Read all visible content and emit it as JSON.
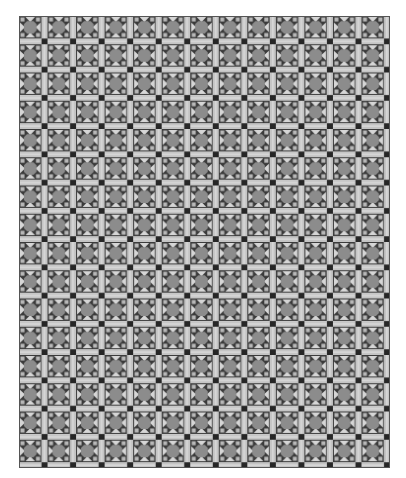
{
  "image": {
    "description": "Repeating quilt pattern of square blocks with sashing",
    "columns": 13,
    "rows": 16,
    "tile_size_px": 28.5
  },
  "colors": {
    "background": "#ffffff",
    "block_dark": "#3a3a3a",
    "center_square": "#8c8c8c",
    "triangles": "#d6d6d6",
    "sashing": "#c4c4c4",
    "cornerstone": "#262626",
    "corner_squares": "#b8b8b8"
  }
}
